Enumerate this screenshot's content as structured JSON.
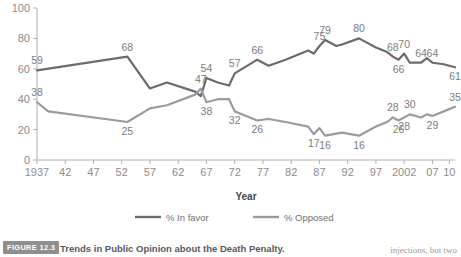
{
  "figure": {
    "badge": "FIGURE 12.3",
    "caption": "Trends in Public Opinion about the Death Penalty.",
    "body_text_fragment": "injections, but two"
  },
  "axis": {
    "x_title": "Year",
    "y_ticks": [
      "0",
      "20",
      "40",
      "60",
      "80",
      "100"
    ],
    "x_ticks": [
      "1937",
      "42",
      "47",
      "52",
      "57",
      "62",
      "67",
      "72",
      "77",
      "82",
      "87",
      "92",
      "97",
      "2002",
      "07",
      "10"
    ]
  },
  "legend": {
    "position": "bottom-center",
    "items": [
      {
        "label": "% In favor",
        "color": "#6b6b6b"
      },
      {
        "label": "% Opposed",
        "color": "#9b9b9b"
      }
    ]
  },
  "colors": {
    "in_favor": "#6b6b6b",
    "opposed": "#9b9b9b",
    "axis": "#b0b0b0",
    "tick_text": "#8c8c8c",
    "point_label": "#7d7d7d",
    "badge_bg": "#8f8f8f",
    "caption_text": "#5a5a5a"
  },
  "chart_data": {
    "type": "line",
    "title": "Trends in Public Opinion about the Death Penalty.",
    "xlabel": "Year",
    "ylabel": "",
    "xlim": [
      1937,
      2011
    ],
    "ylim": [
      0,
      100
    ],
    "grid": false,
    "legend_position": "bottom-center",
    "series": [
      {
        "name": "% In favor",
        "color": "#6b6b6b",
        "points": [
          {
            "x": 1937,
            "y": 59,
            "label": "59",
            "label_pos": "above"
          },
          {
            "x": 1953,
            "y": 68,
            "label": "68",
            "label_pos": "above"
          },
          {
            "x": 1957,
            "y": 47
          },
          {
            "x": 1960,
            "y": 51
          },
          {
            "x": 1965,
            "y": 45
          },
          {
            "x": 1966,
            "y": 42
          },
          {
            "x": 1967,
            "y": 54,
            "label": "54",
            "label_pos": "above"
          },
          {
            "x": 1969,
            "y": 51
          },
          {
            "x": 1971,
            "y": 49
          },
          {
            "x": 1972,
            "y": 57,
            "label": "57",
            "label_pos": "above"
          },
          {
            "x": 1976,
            "y": 66,
            "label": "66",
            "label_pos": "above"
          },
          {
            "x": 1978,
            "y": 62
          },
          {
            "x": 1981,
            "y": 66
          },
          {
            "x": 1985,
            "y": 72
          },
          {
            "x": 1986,
            "y": 70
          },
          {
            "x": 1987,
            "y": 75,
            "label": "75",
            "label_pos": "above"
          },
          {
            "x": 1988,
            "y": 79,
            "label": "79",
            "label_pos": "above"
          },
          {
            "x": 1990,
            "y": 75
          },
          {
            "x": 1991,
            "y": 76
          },
          {
            "x": 1994,
            "y": 80,
            "label": "80",
            "label_pos": "above"
          },
          {
            "x": 1997,
            "y": 74
          },
          {
            "x": 1999,
            "y": 71
          },
          {
            "x": 2000,
            "y": 68,
            "label": "68",
            "label_pos": "above"
          },
          {
            "x": 2001,
            "y": 66,
            "label": "66",
            "label_pos": "below"
          },
          {
            "x": 2002,
            "y": 70,
            "label": "70",
            "label_pos": "above"
          },
          {
            "x": 2003,
            "y": 64
          },
          {
            "x": 2005,
            "y": 64,
            "label": "64",
            "label_pos": "above"
          },
          {
            "x": 2006,
            "y": 67
          },
          {
            "x": 2007,
            "y": 64,
            "label": "64",
            "label_pos": "above"
          },
          {
            "x": 2009,
            "y": 63
          },
          {
            "x": 2011,
            "y": 61,
            "label": "61",
            "label_pos": "below"
          }
        ]
      },
      {
        "name": "% Opposed",
        "color": "#9b9b9b",
        "points": [
          {
            "x": 1937,
            "y": 38,
            "label": "38",
            "label_pos": "above"
          },
          {
            "x": 1939,
            "y": 32
          },
          {
            "x": 1953,
            "y": 25,
            "label": "25",
            "label_pos": "below"
          },
          {
            "x": 1957,
            "y": 34
          },
          {
            "x": 1960,
            "y": 36
          },
          {
            "x": 1965,
            "y": 43
          },
          {
            "x": 1966,
            "y": 47,
            "label": "47",
            "label_pos": "above"
          },
          {
            "x": 1967,
            "y": 38,
            "label": "38",
            "label_pos": "below"
          },
          {
            "x": 1969,
            "y": 40
          },
          {
            "x": 1971,
            "y": 40
          },
          {
            "x": 1972,
            "y": 32,
            "label": "32",
            "label_pos": "below"
          },
          {
            "x": 1976,
            "y": 26,
            "label": "26",
            "label_pos": "below"
          },
          {
            "x": 1978,
            "y": 27
          },
          {
            "x": 1981,
            "y": 25
          },
          {
            "x": 1985,
            "y": 22
          },
          {
            "x": 1986,
            "y": 17,
            "label": "17",
            "label_pos": "below"
          },
          {
            "x": 1987,
            "y": 21
          },
          {
            "x": 1988,
            "y": 16,
            "label": "16",
            "label_pos": "below"
          },
          {
            "x": 1991,
            "y": 18
          },
          {
            "x": 1994,
            "y": 16,
            "label": "16",
            "label_pos": "below"
          },
          {
            "x": 1997,
            "y": 22
          },
          {
            "x": 1999,
            "y": 25
          },
          {
            "x": 2000,
            "y": 28,
            "label": "28",
            "label_pos": "above"
          },
          {
            "x": 2001,
            "y": 26,
            "label": "26",
            "label_pos": "below"
          },
          {
            "x": 2002,
            "y": 28,
            "label": "28",
            "label_pos": "below"
          },
          {
            "x": 2003,
            "y": 30,
            "label": "30",
            "label_pos": "above"
          },
          {
            "x": 2005,
            "y": 28
          },
          {
            "x": 2006,
            "y": 30
          },
          {
            "x": 2007,
            "y": 29,
            "label": "29",
            "label_pos": "below"
          },
          {
            "x": 2009,
            "y": 32
          },
          {
            "x": 2011,
            "y": 35,
            "label": "35",
            "label_pos": "above"
          }
        ]
      }
    ]
  }
}
